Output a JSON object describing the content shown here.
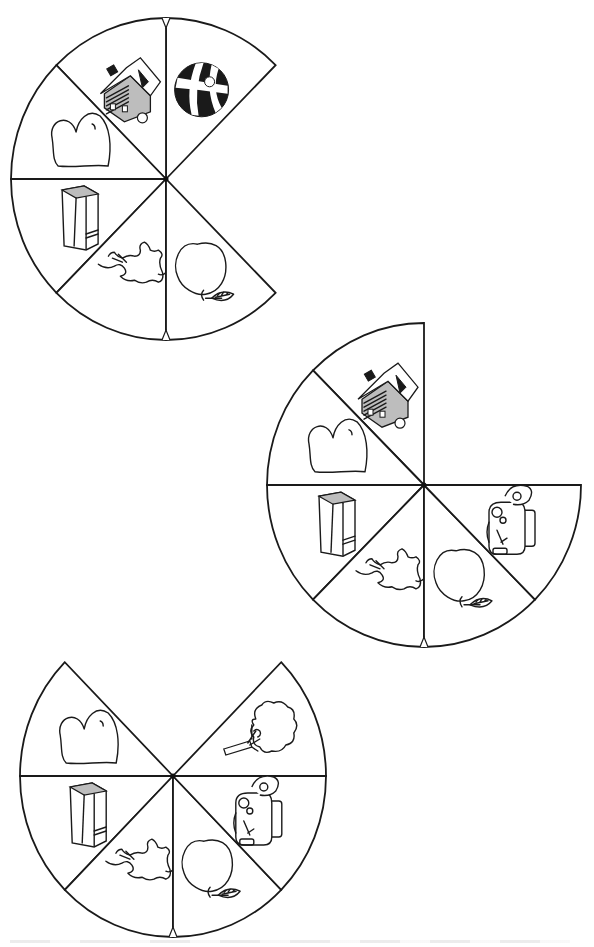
{
  "page": {
    "background": "#ffffff",
    "ink_color": "#1a1a1a"
  },
  "wheels": [
    {
      "id": "wheel-1",
      "center": [
        166,
        179
      ],
      "rx": 155,
      "ry": 161,
      "sectors": [
        {
          "from": 45,
          "to": 90,
          "icon": "ball"
        },
        {
          "from": 90,
          "to": 135,
          "icon": "house"
        },
        {
          "from": 135,
          "to": 180,
          "icon": "heart"
        },
        {
          "from": 180,
          "to": 225,
          "icon": "book"
        },
        {
          "from": 225,
          "to": 270,
          "icon": "elephant"
        },
        {
          "from": 270,
          "to": 315,
          "icon": "apple"
        }
      ],
      "notches": [
        90,
        270
      ]
    },
    {
      "id": "wheel-2",
      "center": [
        424,
        485
      ],
      "rx": 157,
      "ry": 162,
      "sectors": [
        {
          "from": 90,
          "to": 135,
          "icon": "house"
        },
        {
          "from": 135,
          "to": 180,
          "icon": "heart"
        },
        {
          "from": 180,
          "to": 225,
          "icon": "book"
        },
        {
          "from": 225,
          "to": 270,
          "icon": "elephant"
        },
        {
          "from": 270,
          "to": 315,
          "icon": "apple"
        },
        {
          "from": 315,
          "to": 360,
          "icon": "backpack"
        }
      ],
      "notches": [
        270
      ]
    },
    {
      "id": "wheel-3",
      "center": [
        173,
        776
      ],
      "rx": 153,
      "ry": 161,
      "sectors": [
        {
          "from": 0,
          "to": 45,
          "icon": "tree"
        },
        {
          "from": 135,
          "to": 180,
          "icon": "heart"
        },
        {
          "from": 180,
          "to": 225,
          "icon": "book"
        },
        {
          "from": 225,
          "to": 270,
          "icon": "elephant"
        },
        {
          "from": 270,
          "to": 315,
          "icon": "apple"
        },
        {
          "from": 315,
          "to": 360,
          "icon": "backpack"
        }
      ],
      "notches": [
        270
      ]
    }
  ],
  "icons": {
    "ball": "beach-ball-icon",
    "house": "house-icon",
    "heart": "heart-icon",
    "book": "book-icon",
    "elephant": "elephant-icon",
    "apple": "apple-icon",
    "backpack": "backpack-icon",
    "tree": "tree-icon"
  }
}
